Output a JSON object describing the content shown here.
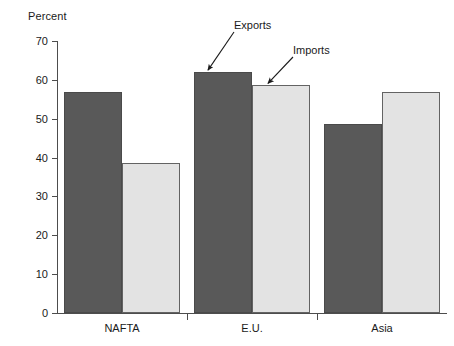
{
  "chart_data": {
    "type": "bar",
    "title": "",
    "subtitle": "",
    "xlabel": "",
    "ylabel": "Percent",
    "categories": [
      "NAFTA",
      "E.U.",
      "Asia"
    ],
    "series": [
      {
        "name": "Exports",
        "values": [
          56.8,
          62.0,
          48.7
        ],
        "color": "#595959"
      },
      {
        "name": "Imports",
        "values": [
          38.6,
          58.6,
          56.9
        ],
        "color": "#e3e3e3"
      }
    ],
    "ylim": [
      0,
      70
    ],
    "ytick_values": [
      0,
      10,
      20,
      30,
      40,
      50,
      60,
      70
    ],
    "ytick_labels": [
      "0",
      "10",
      "20",
      "30",
      "40",
      "50",
      "60",
      "70"
    ],
    "grid": false,
    "legend": "none",
    "annotations": [
      {
        "text": "Exports",
        "target_series": "Exports",
        "target_category": "E.U."
      },
      {
        "text": "Imports",
        "target_series": "Imports",
        "target_category": "E.U."
      }
    ]
  },
  "axis": {
    "y_title": "Percent"
  },
  "annotations": {
    "exports_label": "Exports",
    "imports_label": "Imports"
  }
}
